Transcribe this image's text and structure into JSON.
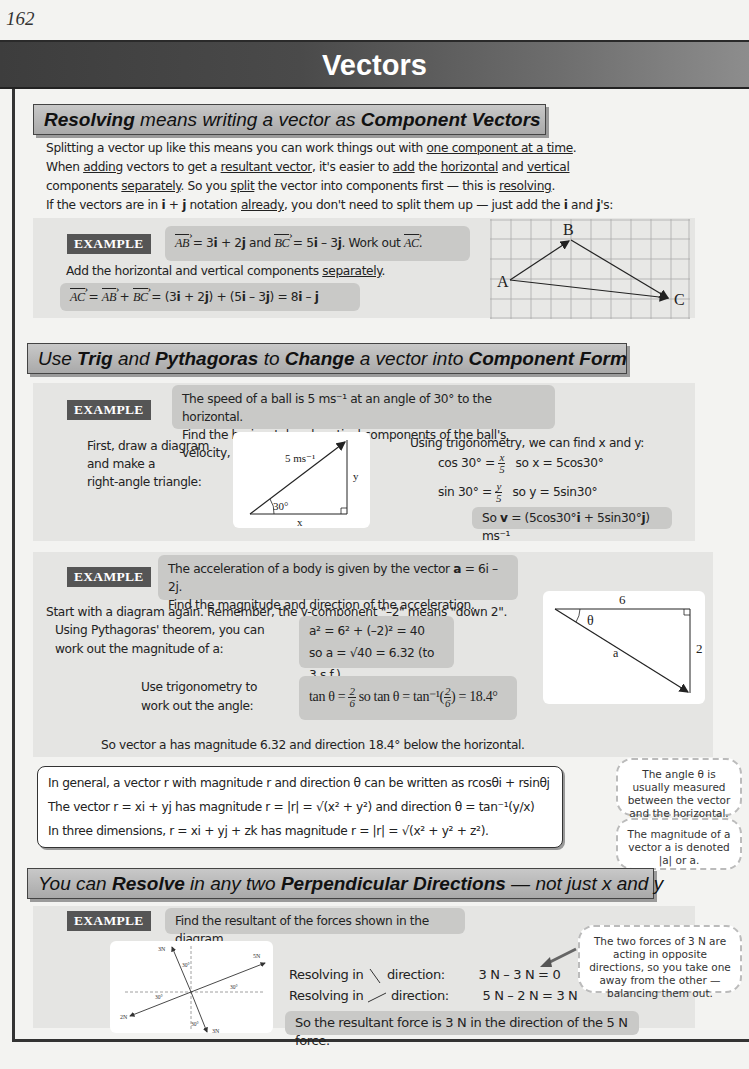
{
  "page_number": "162",
  "title": "Vectors",
  "sections": [
    {
      "header": {
        "part1": "Resolving",
        "part2": " means writing a vector as ",
        "part3": "Component Vectors"
      },
      "intro": [
        {
          "pre": "Splitting a vector up like this means you can work things out with ",
          "u1": "one component at a time",
          "post": "."
        },
        {
          "pre": "When ",
          "u1": "adding",
          "mid1": " vectors to get a ",
          "u2": "resultant vector",
          "mid2": ", it's easier to ",
          "u3": "add",
          "mid3": " the ",
          "u4": "horizontal",
          "mid4": " and ",
          "u5": "vertical"
        },
        {
          "pre": "components ",
          "u1": "separately",
          "mid1": ".  So you ",
          "u2": "split",
          "mid2": " the vector into components first — this is ",
          "u3": "resolving",
          "post": "."
        },
        {
          "pre": "If the vectors are in ",
          "b1": "i",
          "mid1": " + ",
          "b2": "j",
          "mid2": " notation ",
          "u1": "already",
          "mid3": ", you don't need to split them up — just add the ",
          "b3": "i",
          "mid4": " and ",
          "b4": "j",
          "post": "'s:"
        }
      ],
      "example": {
        "tag": "EXAMPLE",
        "question": {
          "ab": "AB",
          "t1": " = 3",
          "i1": "i",
          "t2": " + 2",
          "j1": "j",
          "t3": " and ",
          "bc": "BC",
          "t4": " = 5",
          "i2": "i",
          "t5": " – 3",
          "j2": "j",
          "t6": ".  Work out ",
          "ac": "AC",
          "t7": "."
        },
        "instruction_pre": "Add the horizontal and vertical components ",
        "instruction_u": "separately",
        "instruction_post": ".",
        "answer": {
          "ac": "AC",
          "t1": " = ",
          "ab": "AB",
          "t2": " + ",
          "bc": "BC",
          "t3": " = (3",
          "i1": "i",
          "t4": " + 2",
          "j1": "j",
          "t5": ") + (5",
          "i2": "i",
          "t6": " – 3",
          "j2": "j",
          "t7": ")  = 8",
          "i3": "i",
          "t8": " – ",
          "j3": "j"
        },
        "diagram": {
          "label_a": "A",
          "label_b": "B",
          "label_c": "C"
        }
      }
    },
    {
      "header": {
        "t1": "Use ",
        "b1": "Trig",
        "t2": " and ",
        "b2": "Pythagoras",
        "t3": " to ",
        "b3": "Change",
        "t4": " a vector into ",
        "b4": "Component Form"
      },
      "example1": {
        "tag": "EXAMPLE",
        "question_line1": "The speed of a ball is 5 ms⁻¹ at an angle of 30° to the horizontal.",
        "question_line2_pre": "Find the horizontal and vertical components of the ball's velocity, ",
        "question_line2_bold": "v",
        "question_line2_post": ".",
        "left_text": [
          "First, draw a diagram",
          "and make a",
          "right-angle triangle:"
        ],
        "diagram": {
          "hyp": "5 ms⁻¹",
          "angle": "30°",
          "side_y": "y",
          "side_x": "x"
        },
        "trig_intro": "Using trigonometry, we can find x and y:",
        "cos_line": {
          "lhs": "cos 30° = ",
          "num": "x",
          "den": "5",
          "rhs": "so x = 5cos30°"
        },
        "sin_line": {
          "lhs": "sin 30° = ",
          "num": "y",
          "den": "5",
          "rhs": "so y = 5sin30°"
        },
        "result": {
          "pre": "So  ",
          "v": "v",
          "t1": " = (5cos30°",
          "i": "i",
          "t2": " + 5sin30°",
          "j": "j",
          "t3": ") ms⁻¹"
        }
      },
      "example2": {
        "tag": "EXAMPLE",
        "question_line1_pre": "The acceleration of a body is given by the vector ",
        "question_line1_a": "a",
        "question_line1_post": " = 6i – 2j.",
        "question_line2": "Find the magnitude and direction of the acceleration.",
        "diagram_note": "Start with a diagram again.  Remember, the y-component \"–2\" means \"down 2\".",
        "pyth_text": [
          "Using Pythagoras' theorem, you can",
          "work out the magnitude of a:"
        ],
        "pyth_line1": "a² = 6² + (–2)² = 40",
        "pyth_line2": "so a = √40 = 6.32 (to 3 s.f.)",
        "trig_text": [
          "Use trigonometry to",
          "work out the angle:"
        ],
        "trig_line": {
          "t1": "tan θ = ",
          "n1": "2",
          "d1": "6",
          "t2": " so tan θ = tan⁻¹(",
          "n2": "2",
          "d2": "6",
          "t3": ") = 18.4°"
        },
        "conclusion": "So vector a has magnitude 6.32 and direction 18.4° below the horizontal.",
        "diagram": {
          "top": "6",
          "side": "2",
          "hyp": "a",
          "angle": "θ"
        }
      },
      "summary": [
        "In general, a vector r with magnitude r and direction θ can be written as rcosθi + rsinθj",
        "The vector r = xi + yj has magnitude r = |r| = √(x² + y²) and direction  θ = tan⁻¹(y/x)",
        "In three dimensions, r = xi + yj + zk has magnitude r = |r| = √(x² + y² + z²)."
      ],
      "notes": [
        "The angle θ is usually measured between the vector and the horizontal.",
        "The magnitude of a vector a is denoted |a| or a."
      ]
    },
    {
      "header": {
        "t1": "You can ",
        "b1": "Resolve",
        "t2": " in any two ",
        "b2": "Perpendicular Directions",
        "t3": " — not just x and y"
      },
      "example": {
        "tag": "EXAMPLE",
        "question": "Find the resultant of the forces shown in the diagram.",
        "diagram": {
          "f_up": "3N",
          "f_down": "3N",
          "f_right": "5N",
          "f_left": "2N",
          "angle": "30°"
        },
        "line1": {
          "pre": "Resolving in",
          "dir": "direction:",
          "calc": "3 N – 3 N = 0"
        },
        "line2": {
          "pre": "Resolving in",
          "dir": "direction:",
          "calc": "5 N – 2 N = 3 N"
        },
        "result": "So the resultant force is 3 N in the direction of the 5 N force.",
        "note": "The two forces of 3 N are acting in opposite directions, so you take one away from the other — balancing them out."
      }
    }
  ]
}
